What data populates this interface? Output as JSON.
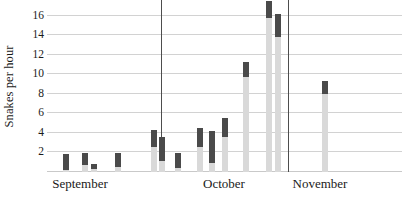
{
  "chart_data": {
    "type": "bar",
    "title": "",
    "subtitle": "",
    "xlabel": "",
    "ylabel": "Snakes per hour",
    "ylim": [
      0,
      17.6
    ],
    "yticks": [
      2,
      4,
      6,
      8,
      10,
      12,
      14,
      16
    ],
    "ytick_labels": [
      "2",
      "4",
      "6",
      "8",
      "10",
      "12",
      "14",
      "16"
    ],
    "grid": true,
    "legend": "none",
    "x_groups": [
      "September",
      "October",
      "November"
    ],
    "group_boundaries_px": [
      161,
      288
    ],
    "series": [
      {
        "name": "Snakes per hour (bar total with dark upper range segment)",
        "note": "Each observation is drawn as a light-grey bar from 0 to the total, with a darker segment marking the upper portion of the range.",
        "values": [
          1.8,
          1.9,
          0.8,
          1.9,
          4.3,
          3.6,
          1.9,
          4.5,
          4.2,
          5.5,
          11.3,
          17.5,
          16.2,
          9.3
        ],
        "range_low": [
          0.2,
          0.7,
          0.3,
          0.5,
          2.6,
          1.1,
          0.4,
          2.6,
          0.9,
          3.6,
          9.7,
          15.8,
          13.8,
          8.0
        ],
        "groups": [
          "September",
          "September",
          "September",
          "September",
          "September",
          "September",
          "September",
          "October",
          "October",
          "October",
          "October",
          "October",
          "October",
          "November"
        ]
      }
    ],
    "bars": [
      {
        "group": "September",
        "x_px": 16,
        "total": 1.8,
        "range_low": 0.2
      },
      {
        "group": "September",
        "x_px": 35,
        "total": 1.9,
        "range_low": 0.7
      },
      {
        "group": "September",
        "x_px": 44,
        "total": 0.8,
        "range_low": 0.3
      },
      {
        "group": "September",
        "x_px": 68,
        "total": 1.9,
        "range_low": 0.5
      },
      {
        "group": "September",
        "x_px": 104,
        "total": 4.3,
        "range_low": 2.6
      },
      {
        "group": "September",
        "x_px": 112,
        "total": 3.6,
        "range_low": 1.1
      },
      {
        "group": "September",
        "x_px": 128,
        "total": 1.9,
        "range_low": 0.4
      },
      {
        "group": "October",
        "x_px": 150,
        "total": 4.5,
        "range_low": 2.6
      },
      {
        "group": "October",
        "x_px": 162,
        "total": 4.2,
        "range_low": 0.9
      },
      {
        "group": "October",
        "x_px": 175,
        "total": 5.5,
        "range_low": 3.6
      },
      {
        "group": "October",
        "x_px": 196,
        "total": 11.3,
        "range_low": 9.7
      },
      {
        "group": "October",
        "x_px": 219,
        "total": 17.5,
        "range_low": 15.8
      },
      {
        "group": "October",
        "x_px": 228,
        "total": 16.2,
        "range_low": 13.8
      },
      {
        "group": "November",
        "x_px": 275,
        "total": 9.3,
        "range_low": 8.0
      }
    ],
    "colors": {
      "bar_fill": "#d9d9d9",
      "range_fill": "#4a4a4a",
      "gridline": "#d2d2d2",
      "separator": "#4d4d4d",
      "text": "#1a1a1a"
    }
  },
  "axis": {
    "y_title": "Snakes per hour"
  },
  "months": [
    {
      "label": "September",
      "center_px": 80
    },
    {
      "label": "October",
      "center_px": 224
    },
    {
      "label": "November",
      "center_px": 320
    }
  ]
}
